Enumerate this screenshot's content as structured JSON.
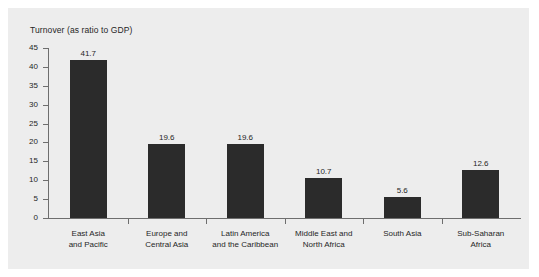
{
  "chart_data": {
    "type": "bar",
    "title": "Turnover (as ratio to GDP)",
    "xlabel": "",
    "ylabel": "",
    "ylim": [
      0,
      45
    ],
    "ytick_step": 5,
    "grid": false,
    "legend": false,
    "categories": [
      "East Asia and Pacific",
      "Europe and Central Asia",
      "Latin America and the Caribbean",
      "Middle East and North Africa",
      "South Asia",
      "Sub-Saharan Africa"
    ],
    "category_lines": [
      [
        "East Asia",
        "and Pacific"
      ],
      [
        "Europe and",
        "Central Asia"
      ],
      [
        "Latin America",
        "and the Caribbean"
      ],
      [
        "Middle East and",
        "North Africa"
      ],
      [
        "South Asia"
      ],
      [
        "Sub-Saharan",
        "Africa"
      ]
    ],
    "values": [
      41.7,
      19.6,
      19.6,
      10.7,
      5.6,
      12.6
    ],
    "value_labels": [
      "41.7",
      "19.6",
      "19.6",
      "10.7",
      "5.6",
      "12.6"
    ],
    "ytick_labels": [
      "0",
      "5",
      "10",
      "15",
      "20",
      "25",
      "30",
      "35",
      "40",
      "45"
    ],
    "colors": {
      "bar": "#2b2b2b",
      "panel": "#ececec",
      "plot_background": "#ededed",
      "axis": "#6e6e6e",
      "text": "#262626",
      "figure_background": "#ffffff"
    }
  }
}
